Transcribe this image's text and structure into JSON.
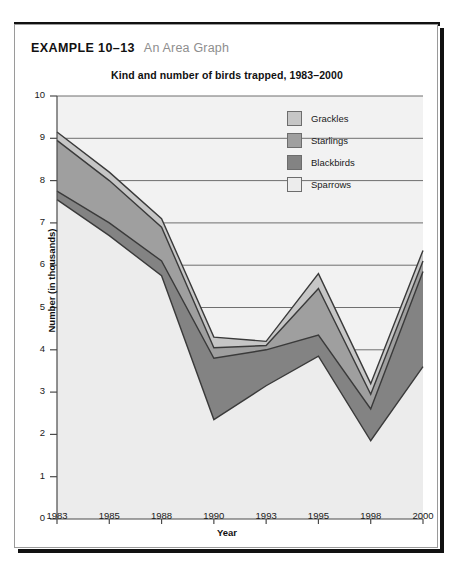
{
  "example": {
    "label": "EXAMPLE 10–13",
    "subtitle": "An Area Graph"
  },
  "chart_data": {
    "type": "area",
    "title": "Kind and number of birds trapped, 1983–2000",
    "xlabel": "Year",
    "ylabel": "Number (in thousands)",
    "stacked": true,
    "grid": true,
    "legend_position": "inside-top-right",
    "ylim": [
      0,
      10
    ],
    "yticks": [
      0,
      1,
      2,
      3,
      4,
      5,
      6,
      7,
      8,
      9,
      10
    ],
    "categories": [
      "1983",
      "1985",
      "1988",
      "1990",
      "1993",
      "1995",
      "1998",
      "2000"
    ],
    "series": [
      {
        "name": "Sparrows",
        "color": "#ececec",
        "values": [
          7.55,
          6.7,
          5.75,
          2.35,
          3.15,
          3.85,
          1.85,
          3.6
        ]
      },
      {
        "name": "Blackbirds",
        "color": "#838383",
        "values": [
          0.2,
          0.3,
          0.35,
          1.45,
          0.85,
          0.5,
          0.75,
          2.25
        ]
      },
      {
        "name": "Starlings",
        "color": "#9f9f9f",
        "values": [
          1.2,
          1.0,
          0.8,
          0.25,
          0.1,
          1.1,
          0.35,
          0.25
        ]
      },
      {
        "name": "Grackles",
        "color": "#c6c6c6",
        "values": [
          0.2,
          0.2,
          0.2,
          0.25,
          0.1,
          0.35,
          0.25,
          0.25
        ]
      }
    ],
    "cumulative_tops": {
      "Sparrows": [
        7.55,
        6.7,
        5.75,
        2.35,
        3.15,
        3.85,
        1.85,
        3.6
      ],
      "Blackbirds": [
        7.75,
        7.0,
        6.1,
        3.8,
        4.0,
        4.35,
        2.6,
        5.85
      ],
      "Starlings": [
        8.95,
        8.0,
        6.9,
        4.05,
        4.1,
        5.45,
        2.95,
        6.1
      ],
      "Grackles": [
        9.15,
        8.2,
        7.1,
        4.3,
        4.2,
        5.8,
        3.2,
        6.35
      ]
    },
    "legend": [
      {
        "label": "Grackles",
        "color": "#c6c6c6"
      },
      {
        "label": "Starlings",
        "color": "#9f9f9f"
      },
      {
        "label": "Blackbirds",
        "color": "#838383"
      },
      {
        "label": "Sparrows",
        "color": "#ececec"
      }
    ]
  }
}
